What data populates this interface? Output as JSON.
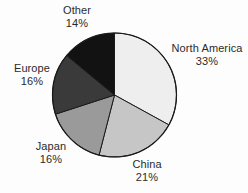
{
  "figure": {
    "background_color": "#fdfdfd",
    "label_text_color": "#2b2b2b"
  },
  "chart_data": {
    "type": "pie",
    "title": "",
    "subtitle": "",
    "xlabel": "",
    "ylabel": "",
    "grid": false,
    "legend": "none",
    "labels_position": "outside",
    "start_angle_deg": 0,
    "direction": "clockwise",
    "units": "percent",
    "total": 100,
    "categories": [
      "North America",
      "China",
      "Japan",
      "Europe",
      "Other"
    ],
    "values": [
      33,
      21,
      16,
      16,
      14
    ],
    "value_labels": [
      "33%",
      "21%",
      "16%",
      "16%",
      "14%"
    ],
    "colors": [
      "#eeeeee",
      "#c6c6c6",
      "#9a9a9a",
      "#3a3a3a",
      "#121212"
    ],
    "slice_edge_color": "#1a1a1a",
    "slices": [
      {
        "name": "North America",
        "value": 33,
        "value_label": "33%",
        "color": "#eeeeee",
        "start_angle_deg": 0,
        "end_angle_deg": 118.8
      },
      {
        "name": "China",
        "value": 21,
        "value_label": "21%",
        "color": "#c6c6c6",
        "start_angle_deg": 118.8,
        "end_angle_deg": 194.4
      },
      {
        "name": "Japan",
        "value": 16,
        "value_label": "16%",
        "color": "#9a9a9a",
        "start_angle_deg": 194.4,
        "end_angle_deg": 252.0
      },
      {
        "name": "Europe",
        "value": 16,
        "value_label": "16%",
        "color": "#3a3a3a",
        "start_angle_deg": 252.0,
        "end_angle_deg": 309.6
      },
      {
        "name": "Other",
        "value": 14,
        "value_label": "14%",
        "color": "#121212",
        "start_angle_deg": 309.6,
        "end_angle_deg": 360.0
      }
    ]
  }
}
